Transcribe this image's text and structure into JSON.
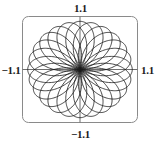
{
  "figure": {
    "title": "",
    "width": 161,
    "height": 147,
    "background_color": "#ffffff",
    "frame_color": "#8a8a8a",
    "axis_color": "#6f6f6f",
    "curve_color": "#1a1a1a"
  },
  "labels": {
    "top": "1.1",
    "bottom": "−1.1",
    "left": "−1.1",
    "right": "1.1"
  },
  "chart_data": {
    "type": "line",
    "title": "",
    "xlabel": "",
    "ylabel": "",
    "xlim": [
      -1.1,
      1.1
    ],
    "ylim": [
      -1.1,
      1.1
    ],
    "grid": false,
    "legend": null,
    "axis_tick_labels": {
      "x": [
        "−1.1",
        "1.1"
      ],
      "y": [
        "−1.1",
        "1.1"
      ]
    },
    "curve": {
      "family": "polar-rose-loops",
      "petal_count": 24,
      "outer_radius": 1.0,
      "loop_half_width_deg": 45,
      "center": [
        0,
        0
      ]
    },
    "series": [
      {
        "name": "rose-curve",
        "closed": true,
        "points_per_loop": 96
      }
    ]
  }
}
